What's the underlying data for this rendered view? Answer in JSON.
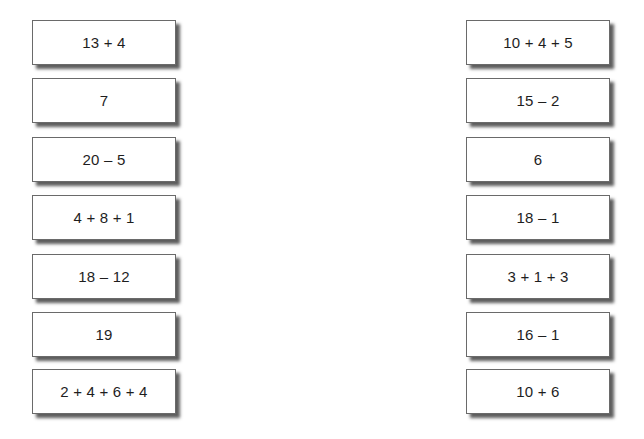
{
  "worksheet": {
    "left_column": {
      "cards": [
        {
          "label": "13 + 4"
        },
        {
          "label": "7"
        },
        {
          "label": "20 – 5"
        },
        {
          "label": "4 + 8 + 1"
        },
        {
          "label": "18 – 12"
        },
        {
          "label": "19"
        },
        {
          "label": "2 + 4 + 6 + 4"
        }
      ]
    },
    "right_column": {
      "cards": [
        {
          "label": "10 + 4 + 5"
        },
        {
          "label": "15 – 2"
        },
        {
          "label": "6"
        },
        {
          "label": "18 – 1"
        },
        {
          "label": "3 + 1 + 3"
        },
        {
          "label": "16 – 1"
        },
        {
          "label": "10 + 6"
        }
      ]
    }
  }
}
